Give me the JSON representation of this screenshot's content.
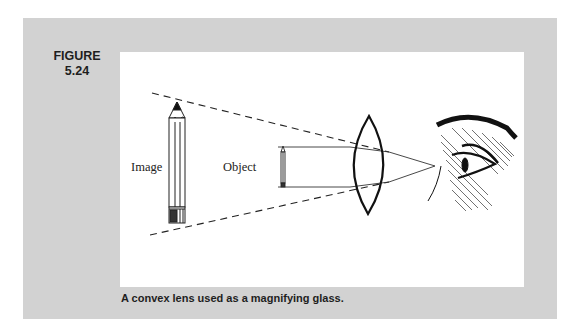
{
  "figure": {
    "label_line1": "FIGURE",
    "label_line2": "5.24",
    "caption": "A convex lens used as a magnifying glass."
  },
  "diagram": {
    "labels": {
      "image": "Image",
      "object": "Object"
    },
    "elements": [
      "virtual-image-pencil",
      "object-pencil",
      "convex-lens",
      "eye",
      "dashed-projection-lines",
      "light-rays",
      "focal-point"
    ]
  },
  "colors": {
    "panel_background": "#d2d2d2",
    "figure_background": "#ffffff",
    "ink": "#1e1e1e"
  }
}
